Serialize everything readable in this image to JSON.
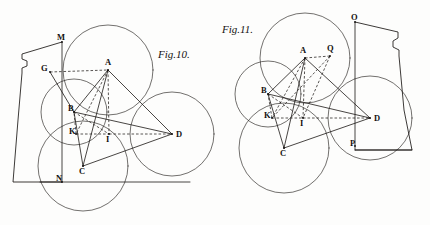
{
  "plate": {
    "width": 430,
    "height": 225,
    "paper_color": "#fdfdfc",
    "ink_color": "#1a1714"
  },
  "figures": [
    {
      "id": "fig10",
      "caption": "Fig.10.",
      "caption_pos": {
        "x": 158,
        "y": 58
      },
      "points": [
        {
          "label": "M",
          "x": 62,
          "y": 42,
          "lx": 57,
          "ly": 40
        },
        {
          "label": "G",
          "x": 50,
          "y": 72,
          "lx": 41,
          "ly": 71
        },
        {
          "label": "A",
          "x": 108,
          "y": 70,
          "lx": 105,
          "ly": 65
        },
        {
          "label": "B",
          "x": 74,
          "y": 112,
          "lx": 68,
          "ly": 111
        },
        {
          "label": "K",
          "x": 76,
          "y": 134,
          "lx": 69,
          "ly": 134
        },
        {
          "label": "I",
          "x": 109,
          "y": 134,
          "lx": 106,
          "ly": 142
        },
        {
          "label": "D",
          "x": 172,
          "y": 134,
          "lx": 176,
          "ly": 137
        },
        {
          "label": "C",
          "x": 83,
          "y": 166,
          "lx": 79,
          "ly": 174
        },
        {
          "label": "N",
          "x": 62,
          "y": 182,
          "lx": 56,
          "ly": 181
        }
      ],
      "circles": [
        {
          "cx": 108,
          "cy": 70,
          "r": 45
        },
        {
          "cx": 74,
          "cy": 112,
          "r": 33
        },
        {
          "cx": 83,
          "cy": 166,
          "r": 45
        },
        {
          "cx": 172,
          "cy": 134,
          "r": 42
        }
      ],
      "solid_lines": [
        {
          "from": "A",
          "to": "B"
        },
        {
          "from": "A",
          "to": "C"
        },
        {
          "from": "A",
          "to": "D"
        },
        {
          "from": "B",
          "to": "C"
        },
        {
          "from": "C",
          "to": "D"
        },
        {
          "from": "B",
          "to": "D"
        },
        {
          "from": "G",
          "to": "B"
        }
      ],
      "dashed_lines": [
        {
          "from": "G",
          "to": "A"
        },
        {
          "from": "A",
          "to": "I"
        },
        {
          "from": "K",
          "to": "I"
        },
        {
          "from": "I",
          "to": "D"
        },
        {
          "from": "K",
          "to": "B"
        },
        {
          "from": "B",
          "to": "I"
        },
        {
          "from": "A",
          "to": "K"
        }
      ],
      "vessel_side": "left",
      "baseline": {
        "x1": 40,
        "y1": 182,
        "x2": 190,
        "y2": 182
      },
      "plumb_line": {
        "x1": 62,
        "y1": 42,
        "x2": 62,
        "y2": 182
      }
    },
    {
      "id": "fig11",
      "caption": "Fig.11.",
      "caption_pos": {
        "x": 222,
        "y": 33
      },
      "points": [
        {
          "label": "O",
          "x": 355,
          "y": 22,
          "lx": 351,
          "ly": 20
        },
        {
          "label": "Q",
          "x": 330,
          "y": 56,
          "lx": 327,
          "ly": 51
        },
        {
          "label": "A",
          "x": 305,
          "y": 58,
          "lx": 300,
          "ly": 53
        },
        {
          "label": "B",
          "x": 268,
          "y": 94,
          "lx": 261,
          "ly": 93
        },
        {
          "label": "K",
          "x": 272,
          "y": 118,
          "lx": 264,
          "ly": 118
        },
        {
          "label": "I",
          "x": 303,
          "y": 118,
          "lx": 300,
          "ly": 126
        },
        {
          "label": "D",
          "x": 370,
          "y": 118,
          "lx": 374,
          "ly": 121
        },
        {
          "label": "C",
          "x": 284,
          "y": 148,
          "lx": 280,
          "ly": 156
        },
        {
          "label": "P",
          "x": 355,
          "y": 146,
          "lx": 350,
          "ly": 146
        }
      ],
      "circles": [
        {
          "cx": 305,
          "cy": 58,
          "r": 45
        },
        {
          "cx": 268,
          "cy": 94,
          "r": 33
        },
        {
          "cx": 284,
          "cy": 148,
          "r": 45
        },
        {
          "cx": 370,
          "cy": 118,
          "r": 42
        }
      ],
      "solid_lines": [
        {
          "from": "A",
          "to": "B"
        },
        {
          "from": "A",
          "to": "C"
        },
        {
          "from": "A",
          "to": "D"
        },
        {
          "from": "B",
          "to": "C"
        },
        {
          "from": "C",
          "to": "D"
        },
        {
          "from": "B",
          "to": "D"
        }
      ],
      "dashed_lines": [
        {
          "from": "A",
          "to": "Q"
        },
        {
          "from": "Q",
          "to": "I"
        },
        {
          "from": "A",
          "to": "I"
        },
        {
          "from": "K",
          "to": "I"
        },
        {
          "from": "I",
          "to": "D"
        },
        {
          "from": "K",
          "to": "B"
        },
        {
          "from": "B",
          "to": "I"
        },
        {
          "from": "A",
          "to": "K"
        },
        {
          "from": "Q",
          "to": "K"
        }
      ],
      "vessel_side": "right",
      "plumb_line": {
        "x1": 355,
        "y1": 22,
        "x2": 355,
        "y2": 150
      },
      "baseline": {
        "x1": 355,
        "y1": 150,
        "x2": 412,
        "y2": 150
      }
    }
  ]
}
